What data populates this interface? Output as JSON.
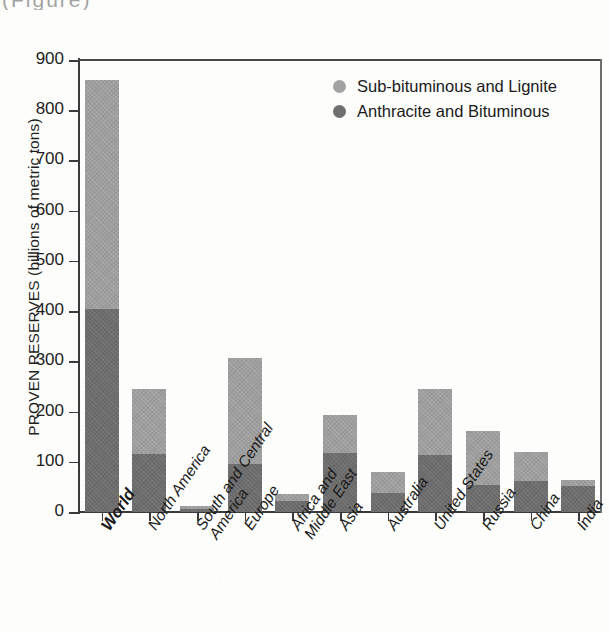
{
  "caption_fragment": "(Figure)",
  "chart_data": {
    "type": "bar",
    "stacked": true,
    "title": "",
    "xlabel": "",
    "ylabel": "PROVEN RESERVES (billions of metric tons)",
    "ylim": [
      0,
      900
    ],
    "ytick_step": 100,
    "yticks": [
      "900",
      "800",
      "700",
      "600",
      "500",
      "400",
      "300",
      "200",
      "100",
      "0"
    ],
    "ytick_values": [
      900,
      800,
      700,
      600,
      500,
      400,
      300,
      200,
      100,
      0
    ],
    "grid": false,
    "legend_position": "top-right",
    "categories": [
      "World",
      "North America",
      "South and Central America",
      "Europe",
      "Africa and Middle East",
      "Asia",
      "Australia",
      "United States",
      "Russia",
      "China",
      "India"
    ],
    "category_labels": [
      [
        "World"
      ],
      [
        "North America"
      ],
      [
        "South and Central",
        "America"
      ],
      [
        "Europe"
      ],
      [
        "Africa and",
        "Middle East"
      ],
      [
        "Asia"
      ],
      [
        "Australia"
      ],
      [
        "United States"
      ],
      [
        "Russia"
      ],
      [
        "China"
      ],
      [
        "India"
      ]
    ],
    "series": [
      {
        "name": "Anthracite and Bituminous",
        "color": "#6d6d6d",
        "values": [
          404,
          115,
          7,
          96,
          22,
          117,
          38,
          113,
          54,
          62,
          52
        ]
      },
      {
        "name": "Sub-bituminous and Lignite",
        "color": "#9e9e9e",
        "values": [
          456,
          130,
          5,
          211,
          14,
          76,
          42,
          131,
          107,
          58,
          12
        ]
      }
    ],
    "totals": [
      860,
      245,
      12,
      307,
      36,
      193,
      80,
      244,
      161,
      120,
      64
    ],
    "legend": [
      {
        "label": "Sub-bituminous and Lignite",
        "swatch": "sub",
        "color": "#9e9e9e"
      },
      {
        "label": "Anthracite and Bituminous",
        "swatch": "anth",
        "color": "#6d6d6d"
      }
    ]
  }
}
